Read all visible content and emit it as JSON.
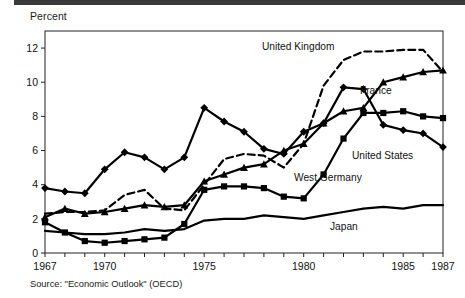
{
  "figure": {
    "unit_label": "Percent",
    "source_note": "Source: \"Economic Outlook\" (OECD)"
  },
  "axis": {
    "y_ticks": [
      "0",
      "2",
      "4",
      "6",
      "8",
      "10",
      "12"
    ],
    "x_ticks": [
      "1967",
      "1970",
      "1975",
      "1980",
      "1985",
      "1987"
    ]
  },
  "labels": {
    "united_kingdom": "United Kingdom",
    "france": "France",
    "united_states": "United States",
    "west_germany": "West Germany",
    "japan": "Japan"
  },
  "chart_data": {
    "type": "line",
    "title": "",
    "subtitle": "",
    "xlabel": "",
    "ylabel": "Percent",
    "xlim": [
      1967,
      1987
    ],
    "ylim": [
      0,
      13
    ],
    "grid": false,
    "legend": "inline-annotations",
    "x": [
      1967,
      1968,
      1969,
      1970,
      1971,
      1972,
      1973,
      1974,
      1975,
      1976,
      1977,
      1978,
      1979,
      1980,
      1981,
      1982,
      1983,
      1984,
      1985,
      1986,
      1987
    ],
    "series": [
      {
        "name": "United States",
        "style": "solid",
        "marker": "diamond",
        "values": [
          3.8,
          3.6,
          3.5,
          4.9,
          5.9,
          5.6,
          4.9,
          5.6,
          8.5,
          7.7,
          7.1,
          6.1,
          5.8,
          7.1,
          7.6,
          9.7,
          9.6,
          7.5,
          7.2,
          7.0,
          6.2
        ]
      },
      {
        "name": "France",
        "style": "solid",
        "marker": "triangle",
        "values": [
          2.1,
          2.6,
          2.3,
          2.4,
          2.6,
          2.8,
          2.7,
          2.8,
          4.2,
          4.6,
          5.0,
          5.2,
          6.0,
          6.4,
          7.6,
          8.3,
          8.5,
          10.0,
          10.3,
          10.6,
          10.7
        ]
      },
      {
        "name": "United Kingdom",
        "style": "dashed",
        "marker": "none",
        "values": [
          2.3,
          2.4,
          2.4,
          2.5,
          3.4,
          3.7,
          2.6,
          2.5,
          4.0,
          5.5,
          5.8,
          5.7,
          5.0,
          6.4,
          9.8,
          11.3,
          11.8,
          11.8,
          11.9,
          11.9,
          10.6
        ]
      },
      {
        "name": "West Germany",
        "style": "solid",
        "marker": "square",
        "values": [
          1.8,
          1.2,
          0.7,
          0.6,
          0.7,
          0.8,
          0.9,
          1.7,
          3.7,
          3.9,
          3.9,
          3.8,
          3.3,
          3.2,
          4.6,
          6.7,
          8.2,
          8.2,
          8.3,
          8.0,
          7.9
        ]
      },
      {
        "name": "Japan",
        "style": "solid",
        "marker": "none",
        "values": [
          1.3,
          1.2,
          1.1,
          1.1,
          1.2,
          1.4,
          1.3,
          1.4,
          1.9,
          2.0,
          2.0,
          2.2,
          2.1,
          2.0,
          2.2,
          2.4,
          2.6,
          2.7,
          2.6,
          2.8,
          2.8
        ]
      }
    ],
    "annotations": [
      {
        "text": "United Kingdom",
        "near_x": 1980,
        "near_y": 12.6
      },
      {
        "text": "France",
        "near_x": 1985,
        "near_y": 9.6
      },
      {
        "text": "United States",
        "near_x": 1985,
        "near_y": 5.2
      },
      {
        "text": "West Germany",
        "near_x": 1982,
        "near_y": 4.0
      },
      {
        "text": "Japan",
        "near_x": 1984,
        "near_y": 1.5
      }
    ]
  }
}
